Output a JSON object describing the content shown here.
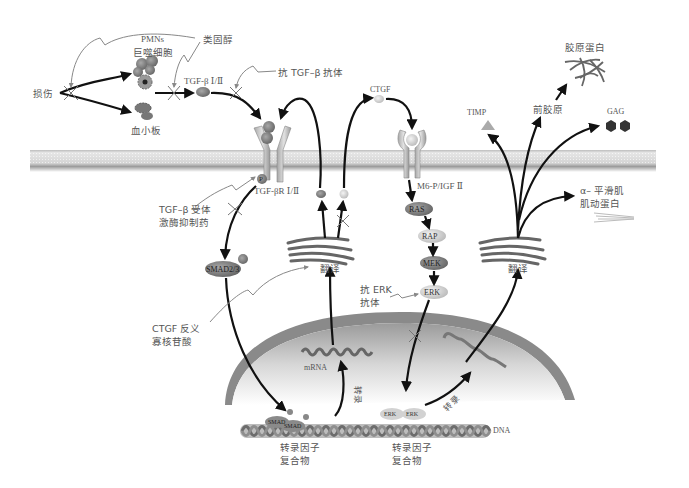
{
  "diagram": {
    "type": "signaling-pathway",
    "colors": {
      "membrane_light": "#d9d9d9",
      "membrane_dark": "#9a9a9a",
      "nucleus_dark": "#8c8c8c",
      "nucleus_light": "#f2f2f2",
      "arrow": "#111111",
      "inhibitor_line": "#8a8a8a",
      "node_dark": "#7a7a7a",
      "node_light": "#cfcfcf"
    },
    "labels": {
      "injury": "损伤",
      "pmns": "PMNs",
      "macrophage": "巨噬细胞",
      "platelet": "血小板",
      "steroid": "类固醇",
      "tgfb": "TGF-β Ⅰ/Ⅱ",
      "anti_tgfb_antibody": "抗 TGF–β 抗体",
      "tgfbr": "TGF-βR Ⅰ/Ⅱ",
      "phospho": "P",
      "tgfbr_kinase_inhibitor_1": "TGF–β 受体",
      "tgfbr_kinase_inhibitor_2": "激酶抑制药",
      "smad": "SMAD2/3",
      "ctgf_antisense_1": "CTGF 反义",
      "ctgf_antisense_2": "寡核苷酸",
      "translation_left": "翻译",
      "translation_right": "翻译",
      "ctgf": "CTGF",
      "m6p_receptor": "M6-P/IGF Ⅱ",
      "ras": "RAS",
      "rap": "RAP",
      "mek": "MEK",
      "erk": "ERK",
      "anti_erk_1": "抗 ERK",
      "anti_erk_2": "抗体",
      "mrna": "mRNA",
      "transcription_left": "转录",
      "transcription_right": "转录",
      "dna": "DNA",
      "tf_complex_left_1": "转录因子",
      "tf_complex_left_2": "复合物",
      "tf_complex_right_1": "转录因子",
      "tf_complex_right_2": "复合物",
      "smad_dna_1": "SMAD",
      "smad_dna_2": "SMAD",
      "erk_dna_1": "ERK",
      "erk_dna_2": "ERK",
      "timp": "TIMP",
      "procollagen": "前胶原",
      "collagen": "胶原蛋白",
      "gag": "GAG",
      "asma_1": "α– 平滑肌",
      "asma_2": "肌动蛋白"
    }
  }
}
